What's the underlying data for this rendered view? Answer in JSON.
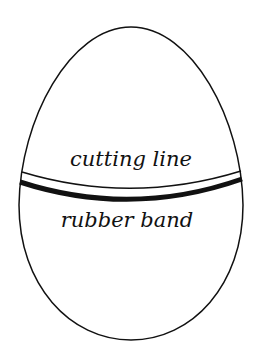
{
  "diagram": {
    "shape": "egg",
    "labels": {
      "cutting_line": "cutting line",
      "rubber_band": "rubber band"
    },
    "colors": {
      "outline": "#111111",
      "band": "#111111",
      "background": "#ffffff"
    }
  }
}
